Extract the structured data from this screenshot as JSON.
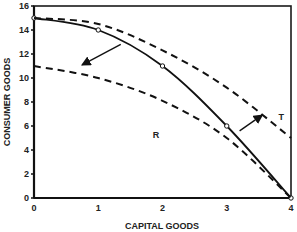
{
  "chart_data": {
    "type": "line",
    "title": "",
    "xlabel": "CAPITAL GOODS",
    "ylabel": "CONSUMER GOODS",
    "xlim": [
      0,
      4
    ],
    "ylim": [
      0,
      16
    ],
    "x_ticks": [
      "0",
      "1",
      "2",
      "3",
      "4"
    ],
    "y_ticks": [
      "0",
      "2",
      "4",
      "6",
      "8",
      "10",
      "12",
      "14",
      "16"
    ],
    "grid": false,
    "legend": null,
    "series": [
      {
        "name": "Production possibilities frontier",
        "style": "solid",
        "markers": true,
        "x": [
          0,
          1,
          2,
          3,
          4
        ],
        "y": [
          15,
          14,
          11,
          6,
          0
        ]
      },
      {
        "name": "Outward shift (T)",
        "style": "dashed",
        "markers": false,
        "x": [
          0,
          1,
          2,
          3,
          4
        ],
        "y": [
          15,
          14.5,
          12.3,
          9.2,
          5
        ]
      },
      {
        "name": "Inward shift (R)",
        "style": "dashed",
        "markers": false,
        "x": [
          0,
          1,
          2,
          3,
          4
        ],
        "y": [
          11,
          10,
          8.1,
          5,
          0
        ]
      }
    ],
    "annotations": [
      {
        "text": "T",
        "x": 3.85,
        "y": 6.5
      },
      {
        "text": "R",
        "x": 1.9,
        "y": 5
      },
      {
        "type": "arrow",
        "direction": "inward",
        "from": [
          1.35,
          12.8
        ],
        "to": [
          0.75,
          11.1
        ]
      },
      {
        "type": "arrow",
        "direction": "outward",
        "from": [
          3.2,
          5.6
        ],
        "to": [
          3.55,
          6.9
        ]
      }
    ]
  }
}
